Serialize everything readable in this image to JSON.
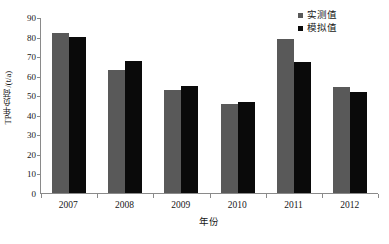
{
  "chart_data": {
    "type": "bar",
    "title": "",
    "xlabel": "年份",
    "ylabel": "TP年负荷/(t/a)",
    "categories": [
      "2007",
      "2008",
      "2009",
      "2010",
      "2011",
      "2012"
    ],
    "series": [
      {
        "name": "实测值",
        "color": "#595959",
        "values": [
          82,
          63,
          52.5,
          45.5,
          79,
          54
        ]
      },
      {
        "name": "模拟值",
        "color": "#0a0a0a",
        "values": [
          80,
          67.5,
          54.5,
          46.5,
          67,
          51.5
        ]
      }
    ],
    "ylim": [
      0,
      90
    ],
    "yticks": [
      0,
      10,
      20,
      30,
      40,
      50,
      60,
      70,
      80,
      90
    ],
    "ytick_labels": [
      "0",
      "10",
      "20",
      "30",
      "40",
      "50",
      "60",
      "70",
      "80",
      "90"
    ],
    "grid": false,
    "legend_position": "top-right"
  }
}
